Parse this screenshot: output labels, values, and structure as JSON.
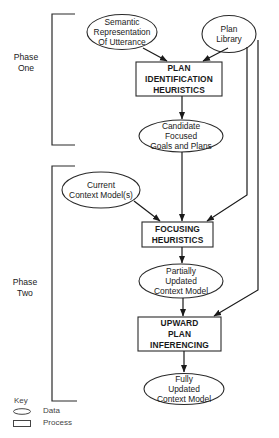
{
  "phases": [
    {
      "id": "phase-one",
      "label_line1": "Phase",
      "label_line2": "One"
    },
    {
      "id": "phase-two",
      "label_line1": "Phase",
      "label_line2": "Two"
    }
  ],
  "nodes": {
    "semantic": {
      "type": "data",
      "lines": [
        "Semantic",
        "Representation",
        "Of Utterance"
      ]
    },
    "plan_library": {
      "type": "data",
      "lines": [
        "Plan",
        "Library"
      ]
    },
    "plan_identification": {
      "type": "process",
      "lines": [
        "PLAN",
        "IDENTIFICATION",
        "HEURISTICS"
      ]
    },
    "candidate": {
      "type": "data",
      "lines": [
        "Candidate",
        "Focused",
        "Goals and Plans"
      ]
    },
    "current_context": {
      "type": "data",
      "lines": [
        "Current",
        "Context Model(s)"
      ]
    },
    "focusing": {
      "type": "process",
      "lines": [
        "FOCUSING",
        "HEURISTICS"
      ]
    },
    "partially_updated": {
      "type": "data",
      "lines": [
        "Partially",
        "Updated",
        "Context Model"
      ]
    },
    "upward": {
      "type": "process",
      "lines": [
        "UPWARD",
        "PLAN",
        "INFERENCING"
      ]
    },
    "fully_updated": {
      "type": "data",
      "lines": [
        "Fully",
        "Updated",
        "Context Model"
      ]
    }
  },
  "edges": [
    {
      "from": "semantic",
      "to": "plan_identification"
    },
    {
      "from": "plan_library",
      "to": "plan_identification"
    },
    {
      "from": "plan_identification",
      "to": "candidate"
    },
    {
      "from": "candidate",
      "to": "focusing"
    },
    {
      "from": "current_context",
      "to": "focusing"
    },
    {
      "from": "plan_library",
      "to": "focusing"
    },
    {
      "from": "focusing",
      "to": "partially_updated"
    },
    {
      "from": "partially_updated",
      "to": "upward"
    },
    {
      "from": "plan_library",
      "to": "upward"
    },
    {
      "from": "upward",
      "to": "fully_updated"
    }
  ],
  "key": {
    "title": "Key",
    "items": [
      {
        "shape": "ellipse",
        "label": "Data"
      },
      {
        "shape": "rectangle",
        "label": "Process"
      }
    ]
  },
  "colors": {
    "stroke": "#2a2a2a",
    "background": "#ffffff",
    "text": "#1a1a1a"
  }
}
